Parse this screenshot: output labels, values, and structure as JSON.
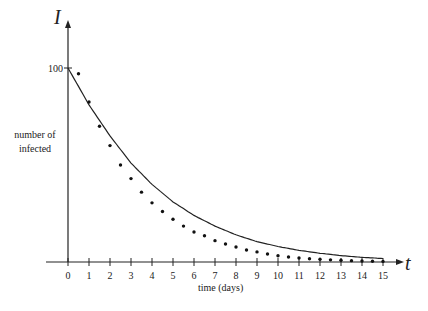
{
  "chart_data": {
    "type": "scatter",
    "title": "",
    "xlabel": "time (days)",
    "ylabel": "number of infected",
    "x_axis_symbol": "t",
    "y_axis_symbol": "I",
    "xlim": [
      0,
      15
    ],
    "ylim": [
      0,
      100
    ],
    "x_ticks": [
      0,
      1,
      2,
      3,
      4,
      5,
      6,
      7,
      8,
      9,
      10,
      11,
      12,
      13,
      14,
      15
    ],
    "y_ticks": [
      100
    ],
    "grid": false,
    "series": [
      {
        "name": "model curve",
        "kind": "line",
        "x": [
          0,
          1,
          2,
          3,
          4,
          5,
          6,
          7,
          8,
          9,
          10,
          11,
          12,
          13,
          14,
          15
        ],
        "values": [
          100,
          81,
          65,
          51,
          40,
          31,
          24,
          18.5,
          14,
          10.5,
          8,
          6,
          4.5,
          3.3,
          2.4,
          1.8
        ]
      },
      {
        "name": "data",
        "kind": "points",
        "x": [
          0.5,
          1,
          1.5,
          2,
          2.5,
          3,
          3.5,
          4,
          4.5,
          5,
          5.5,
          6,
          6.5,
          7,
          7.5,
          8,
          8.5,
          9,
          9.5,
          10,
          10.5,
          11,
          11.5,
          12,
          12.5,
          13,
          13.5,
          14,
          14.5,
          15
        ],
        "values": [
          97,
          82.5,
          70,
          60,
          50,
          43,
          36,
          30.5,
          26,
          22,
          18.5,
          15.5,
          13.5,
          11,
          9.3,
          7.7,
          6.2,
          5.2,
          4.1,
          3.2,
          2.6,
          2.1,
          1.7,
          1.4,
          1.1,
          0.9,
          0.7,
          0.5,
          0.4,
          0.3
        ]
      }
    ]
  }
}
